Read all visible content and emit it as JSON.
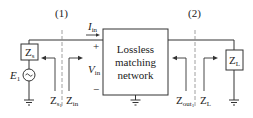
{
  "diagram": {
    "type": "circuit",
    "reference_planes": [
      {
        "id": "plane-1",
        "label": "(1)"
      },
      {
        "id": "plane-2",
        "label": "(2)"
      }
    ],
    "network": {
      "line1": "Lossless",
      "line2": "matching",
      "line3": "network"
    },
    "source": {
      "voltage_label": "E",
      "voltage_sub": "1",
      "impedance_label": "Z",
      "impedance_sub": "s"
    },
    "load": {
      "impedance_label": "Z",
      "impedance_sub": "L"
    },
    "input": {
      "current_label": "I",
      "current_sub": "in",
      "voltage_label": "V",
      "voltage_sub": "in",
      "plus": "+",
      "minus": "−"
    },
    "arrows": {
      "zs1": {
        "main": "Z",
        "sub": "s",
        "subsub": "1"
      },
      "zin": {
        "main": "Z",
        "sub": "in"
      },
      "zout": {
        "main": "Z",
        "sub": "out",
        "subsub": "1"
      },
      "zl": {
        "main": "Z",
        "sub": "L"
      }
    },
    "colors": {
      "line": "#333333",
      "box_fill": "#ffffff",
      "dashed": "#888888"
    }
  }
}
